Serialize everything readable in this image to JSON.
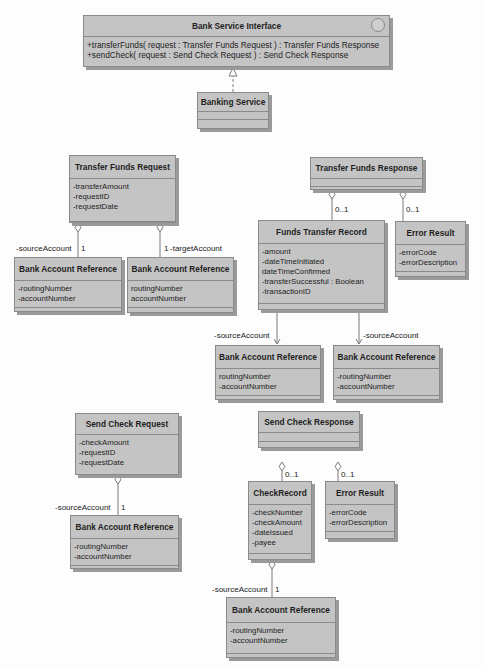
{
  "diagram": {
    "type": "UML class diagram",
    "interface": {
      "name": "Bank Service Interface",
      "operations": [
        "+transferFunds( request : Transfer Funds Request ) : Transfer Funds Response",
        "+sendCheck( request : Send Check Request ) : Send Check Response"
      ]
    },
    "banking_service": {
      "name": "Banking Service"
    },
    "transfer_funds_request": {
      "name": "Transfer Funds Request",
      "attributes": [
        "-transferAmount",
        "-requestID",
        "-requestDate"
      ]
    },
    "bar_tfr_source": {
      "name": "Bank Account Reference",
      "attributes": [
        "-routingNumber",
        "-accountNumber"
      ],
      "role": "-sourceAccount",
      "multiplicity": "1"
    },
    "bar_tfr_target": {
      "name": "Bank Account Reference",
      "attributes": [
        "routingNumber",
        "accountNumber"
      ],
      "role": "-targetAccount",
      "multiplicity": "1"
    },
    "transfer_funds_response": {
      "name": "Transfer Funds Response"
    },
    "funds_transfer_record": {
      "name": "Funds Transfer Record",
      "attributes": [
        "-amount",
        "-dateTimeInitiated",
        "dateTimeConfirmed",
        "-transferSuccessful : Boolean",
        "-transactionID"
      ],
      "multiplicity": "0..1"
    },
    "error_result_1": {
      "name": "Error Result",
      "attributes": [
        "-errorCode",
        "-errorDescription"
      ],
      "multiplicity": "0..1"
    },
    "bar_ftr_source": {
      "name": "Bank Account Reference",
      "attributes": [
        "routingNumber",
        "-accountNumber"
      ],
      "role": "-sourceAccount"
    },
    "bar_ftr_target": {
      "name": "Bank Account Reference",
      "attributes": [
        "-routingNumber",
        "-accountNumber"
      ],
      "role": "-sourceAccount"
    },
    "send_check_request": {
      "name": "Send Check Request",
      "attributes": [
        "-checkAmount",
        "-requestID",
        "-requestDate"
      ]
    },
    "bar_scr_source": {
      "name": "Bank Account Reference",
      "attributes": [
        "-routingNumber",
        "-accountNumber"
      ],
      "role": "-sourceAccount",
      "multiplicity": "1"
    },
    "send_check_response": {
      "name": "Send Check Response"
    },
    "check_record": {
      "name": "CheckRecord",
      "attributes": [
        "-checkNumber",
        "-checkAmount",
        "-dateIssued",
        "-payee"
      ],
      "multiplicity": "0..1"
    },
    "error_result_2": {
      "name": "Error Result",
      "attributes": [
        "-errorCode",
        "-errorDescription"
      ],
      "multiplicity": "0..1"
    },
    "bar_cr_source": {
      "name": "Bank Account Reference",
      "attributes": [
        "-routingNumber",
        "-accountNumber"
      ],
      "role": "-sourceAccount",
      "multiplicity": "1"
    }
  },
  "colors": {
    "box_fill": "#c4c4c4",
    "box_border": "#8a8a8a",
    "shadow": "#9a9a9a",
    "line": "#7a7a7a",
    "background": "#fdfdfd"
  }
}
